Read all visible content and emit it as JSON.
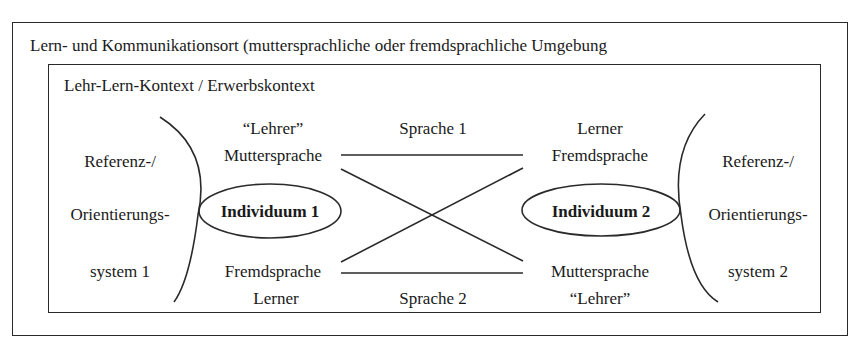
{
  "outer": {
    "label": "Lern- und Kommunikationsort (muttersprachliche oder fremdsprachliche Umgebung"
  },
  "inner": {
    "label": "Lehr-Lern-Kontext / Erwerbskontext"
  },
  "left_system": {
    "line1": "Referenz-/",
    "line2": "Orientierungs-",
    "line3": "system 1"
  },
  "right_system": {
    "line1": "Referenz-/",
    "line2": "Orientierungs-",
    "line3": "system 2"
  },
  "individual_1": {
    "label": "Individuum 1",
    "top_role": "“Lehrer”",
    "top_language": "Muttersprache",
    "bottom_language": "Fremdsprache",
    "bottom_role": "Lerner"
  },
  "individual_2": {
    "label": "Individuum 2",
    "top_role": "Lerner",
    "top_language": "Fremdsprache",
    "bottom_language": "Muttersprache",
    "bottom_role": "“Lehrer”"
  },
  "connections": {
    "top_label": "Sprache 1",
    "bottom_label": "Sprache 2"
  },
  "colors": {
    "stroke": "#2a2a2a",
    "text": "#1a1a1a",
    "background": "#ffffff"
  }
}
